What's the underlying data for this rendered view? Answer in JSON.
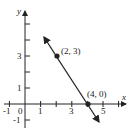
{
  "diagram": {
    "type": "coordinate-plane-line",
    "axes": {
      "x_label": "x",
      "y_label": "y",
      "x_tick_labels": [
        "-1",
        "0",
        "1",
        "3",
        "5"
      ],
      "y_tick_labels": [
        "-1",
        "1",
        "3"
      ]
    },
    "points": [
      {
        "label": "(2, 3)",
        "x": 2,
        "y": 3
      },
      {
        "label": "(4, 0)",
        "x": 4,
        "y": 0
      }
    ],
    "line": {
      "through": [
        [
          2,
          3
        ],
        [
          4,
          0
        ]
      ],
      "arrows": "both"
    },
    "colors": {
      "ink": "#222222",
      "background": "#ffffff"
    }
  }
}
